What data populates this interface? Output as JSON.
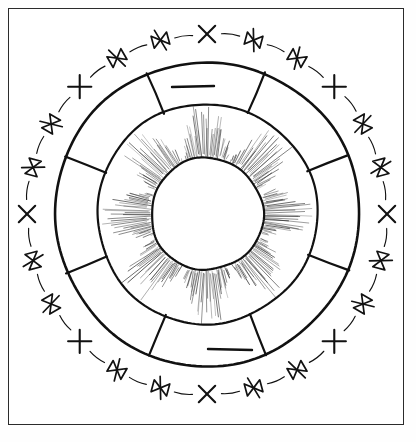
{
  "document": {
    "title": "Circular Wheel Diagram",
    "caption": "",
    "background_color": "#ffffff",
    "ink_color": "#111111",
    "frame_color": "#2b2b2b"
  },
  "figure": {
    "name": "radial-wheel-diagram",
    "center": {
      "x": 207,
      "y": 214
    },
    "rings": [
      {
        "name": "outer-mark-ring",
        "radius": 180,
        "stroke_width": 1.1,
        "style": "thin-broken-arcs"
      },
      {
        "name": "outer-heavy-circle",
        "radius": 152,
        "stroke_width": 2.6,
        "style": "solid"
      },
      {
        "name": "middle-heavy-circle",
        "radius": 110,
        "stroke_width": 2.2,
        "style": "solid"
      },
      {
        "name": "inner-hub-circle",
        "radius": 56,
        "stroke_width": 2.2,
        "style": "solid"
      }
    ],
    "sector_count": 8,
    "spoke_angles_deg": [
      -68,
      -23,
      22,
      67,
      112,
      157,
      202,
      247
    ],
    "hatch": {
      "name": "radial-sunburst-hatch",
      "inner_radius": 58,
      "outer_radius": 108,
      "line_count": 300,
      "stroke_width": 0.55,
      "color": "#3a3a3a"
    },
    "tick_bars": [
      {
        "name": "top-tick-bar",
        "x1": 172,
        "y1": 87,
        "x2": 214,
        "y2": 86,
        "stroke_width": 2.4
      },
      {
        "name": "bottom-tick-bar",
        "x1": 208,
        "y1": 349,
        "x2": 252,
        "y2": 350,
        "stroke_width": 2.4
      }
    ],
    "outer_marks": {
      "total": 24,
      "x_mark_count": 12,
      "bowtie_mark_count": 12,
      "pattern": "alternating",
      "x_mark_label": "X",
      "bowtie_mark_label": "bowtie",
      "angles_deg": [
        {
          "angle": -90,
          "type": "x"
        },
        {
          "angle": -75,
          "type": "bowtie"
        },
        {
          "angle": -60,
          "type": "bowtie"
        },
        {
          "angle": -45,
          "type": "x"
        },
        {
          "angle": -30,
          "type": "bowtie"
        },
        {
          "angle": -15,
          "type": "bowtie"
        },
        {
          "angle": 0,
          "type": "x"
        },
        {
          "angle": 15,
          "type": "bowtie"
        },
        {
          "angle": 30,
          "type": "bowtie"
        },
        {
          "angle": 45,
          "type": "x"
        },
        {
          "angle": 60,
          "type": "bowtie"
        },
        {
          "angle": 75,
          "type": "bowtie"
        },
        {
          "angle": 90,
          "type": "x"
        },
        {
          "angle": 105,
          "type": "bowtie"
        },
        {
          "angle": 120,
          "type": "bowtie"
        },
        {
          "angle": 135,
          "type": "x"
        },
        {
          "angle": 150,
          "type": "bowtie"
        },
        {
          "angle": 165,
          "type": "bowtie"
        },
        {
          "angle": 180,
          "type": "x"
        },
        {
          "angle": 195,
          "type": "bowtie"
        },
        {
          "angle": 210,
          "type": "bowtie"
        },
        {
          "angle": 225,
          "type": "x"
        },
        {
          "angle": 240,
          "type": "bowtie"
        },
        {
          "angle": 255,
          "type": "bowtie"
        }
      ]
    }
  }
}
